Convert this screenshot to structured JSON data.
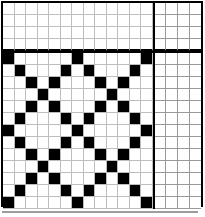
{
  "puzzle": {
    "title": "",
    "grid_columns": 13,
    "aux_columns": 4,
    "header_rows": 4,
    "body_rows": 13,
    "colors": {
      "filled": "#000000",
      "empty": "#ffffff",
      "gridline": "#bdbdbd",
      "border": "#000000"
    },
    "symbols": {
      "filled_marker": "X",
      "open_marker": "O",
      "blank": ""
    },
    "header": [
      {
        "clues": [
          "",
          "",
          "",
          "4",
          "",
          "",
          "",
          "",
          "",
          "4",
          "",
          "",
          ""
        ],
        "aux": [
          "",
          "",
          "",
          "O"
        ]
      },
      {
        "clues": [
          "",
          "",
          "3",
          "",
          "3",
          "",
          "",
          "",
          "3",
          "",
          "3",
          "",
          ""
        ],
        "aux": [
          "",
          "",
          "O",
          ""
        ]
      },
      {
        "clues": [
          "",
          "2",
          "",
          "",
          "",
          "2",
          "",
          "2",
          "",
          "",
          "",
          "2",
          ""
        ],
        "aux": [
          "",
          "O",
          "",
          ""
        ]
      },
      {
        "clues": [
          "1",
          "",
          "",
          "",
          "",
          "",
          "1",
          "",
          "",
          "",
          "",
          "",
          "1"
        ],
        "aux": [
          "O",
          "",
          "",
          ""
        ]
      }
    ],
    "body": [
      {
        "filled": [
          0,
          6,
          12
        ],
        "aux": [
          "X",
          "",
          "",
          ""
        ]
      },
      {
        "filled": [
          1,
          5,
          7,
          11
        ],
        "aux": [
          "",
          "X",
          "",
          ""
        ]
      },
      {
        "filled": [
          2,
          4,
          8,
          10
        ],
        "aux": [
          "",
          "",
          "X",
          ""
        ]
      },
      {
        "filled": [
          3,
          9
        ],
        "aux": [
          "",
          "",
          "",
          "X"
        ]
      },
      {
        "filled": [
          2,
          4,
          8,
          10
        ],
        "aux": [
          "",
          "",
          "X",
          ""
        ]
      },
      {
        "filled": [
          1,
          5,
          7,
          11
        ],
        "aux": [
          "",
          "X",
          "",
          ""
        ]
      },
      {
        "filled": [
          0,
          6,
          12
        ],
        "aux": [
          "X",
          "",
          "",
          ""
        ]
      },
      {
        "filled": [
          1,
          5,
          7,
          11
        ],
        "aux": [
          "",
          "X",
          "",
          ""
        ]
      },
      {
        "filled": [
          2,
          4,
          8,
          10
        ],
        "aux": [
          "",
          "",
          "X",
          ""
        ]
      },
      {
        "filled": [
          3,
          9
        ],
        "aux": [
          "",
          "",
          "",
          "X"
        ]
      },
      {
        "filled": [
          2,
          4,
          8,
          10
        ],
        "aux": [
          "",
          "",
          "X",
          ""
        ]
      },
      {
        "filled": [
          1,
          5,
          7,
          11
        ],
        "aux": [
          "",
          "X",
          "",
          ""
        ]
      },
      {
        "filled": [
          0,
          6,
          12
        ],
        "aux": [
          "X",
          "",
          "",
          ""
        ]
      }
    ]
  },
  "chart_data": {
    "type": "heatmap",
    "title": "",
    "xlabel": "",
    "ylabel": "",
    "categories": [
      "c0",
      "c1",
      "c2",
      "c3",
      "c4",
      "c5",
      "c6",
      "c7",
      "c8",
      "c9",
      "c10",
      "c11",
      "c12"
    ],
    "legend": [
      "filled = X",
      "open = O"
    ],
    "series": [
      {
        "name": "row0",
        "values": [
          1,
          0,
          0,
          0,
          0,
          0,
          1,
          0,
          0,
          0,
          0,
          0,
          1
        ]
      },
      {
        "name": "row1",
        "values": [
          0,
          1,
          0,
          0,
          0,
          1,
          0,
          1,
          0,
          0,
          0,
          1,
          0
        ]
      },
      {
        "name": "row2",
        "values": [
          0,
          0,
          1,
          0,
          1,
          0,
          0,
          0,
          1,
          0,
          1,
          0,
          0
        ]
      },
      {
        "name": "row3",
        "values": [
          0,
          0,
          0,
          1,
          0,
          0,
          0,
          0,
          0,
          1,
          0,
          0,
          0
        ]
      },
      {
        "name": "row4",
        "values": [
          0,
          0,
          1,
          0,
          1,
          0,
          0,
          0,
          1,
          0,
          1,
          0,
          0
        ]
      },
      {
        "name": "row5",
        "values": [
          0,
          1,
          0,
          0,
          0,
          1,
          0,
          1,
          0,
          0,
          0,
          1,
          0
        ]
      },
      {
        "name": "row6",
        "values": [
          1,
          0,
          0,
          0,
          0,
          0,
          1,
          0,
          0,
          0,
          0,
          0,
          1
        ]
      },
      {
        "name": "row7",
        "values": [
          0,
          1,
          0,
          0,
          0,
          1,
          0,
          1,
          0,
          0,
          0,
          1,
          0
        ]
      },
      {
        "name": "row8",
        "values": [
          0,
          0,
          1,
          0,
          1,
          0,
          0,
          0,
          1,
          0,
          1,
          0,
          0
        ]
      },
      {
        "name": "row9",
        "values": [
          0,
          0,
          0,
          1,
          0,
          0,
          0,
          0,
          0,
          1,
          0,
          0,
          0
        ]
      },
      {
        "name": "row10",
        "values": [
          0,
          0,
          1,
          0,
          1,
          0,
          0,
          0,
          1,
          0,
          1,
          0,
          0
        ]
      },
      {
        "name": "row11",
        "values": [
          0,
          1,
          0,
          0,
          0,
          1,
          0,
          1,
          0,
          0,
          0,
          1,
          0
        ]
      },
      {
        "name": "row12",
        "values": [
          1,
          0,
          0,
          0,
          0,
          0,
          1,
          0,
          0,
          0,
          0,
          0,
          1
        ]
      }
    ]
  }
}
